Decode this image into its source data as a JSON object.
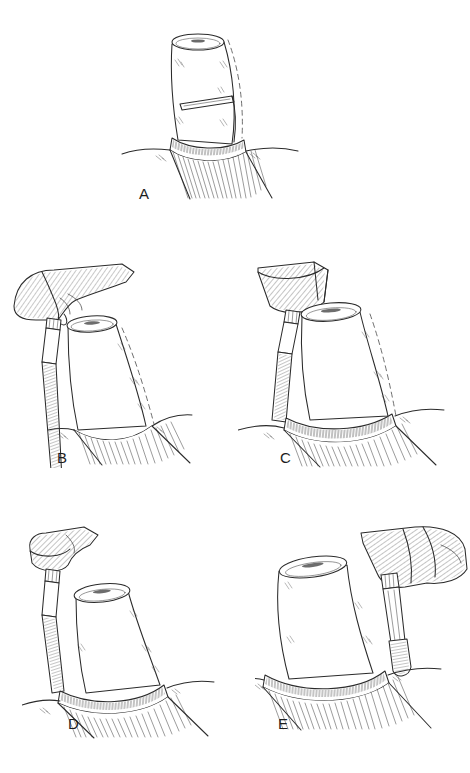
{
  "figure": {
    "background_color": "#ffffff",
    "ink_color": "#2b2b2b",
    "panel_count": 5,
    "labels": {
      "a": "A",
      "b": "B",
      "c": "C",
      "d": "D",
      "e": "E"
    },
    "panels": [
      {
        "id": "a",
        "label": "A",
        "caption_position": "bottom-left",
        "elements": [
          "prepared-tooth-crown",
          "shoulder-step",
          "gingival-collar",
          "gum-line",
          "root-hatching",
          "dashed-original-contour"
        ]
      },
      {
        "id": "b",
        "label": "B",
        "caption_position": "bottom-left",
        "elements": [
          "hand-holding-handpiece",
          "bur-shank",
          "tapered-bur",
          "prepared-tooth-crown",
          "gum-line",
          "root-hatching",
          "dashed-original-contour"
        ]
      },
      {
        "id": "c",
        "label": "C",
        "caption_position": "bottom-left",
        "elements": [
          "handpiece-head",
          "bur-shank",
          "tapered-bur",
          "prepared-tooth-crown",
          "gingival-collar",
          "gum-line",
          "root-hatching",
          "dashed-original-contour"
        ]
      },
      {
        "id": "d",
        "label": "D",
        "caption_position": "bottom-left",
        "elements": [
          "handpiece-head",
          "bur-shank",
          "tapered-bur",
          "prepared-tooth-crown",
          "gingival-collar",
          "gum-line",
          "root-hatching"
        ]
      },
      {
        "id": "e",
        "label": "E",
        "caption_position": "bottom-left",
        "elements": [
          "hand-holding-handpiece",
          "bur-shank",
          "round-end-bur",
          "prepared-tooth-crown",
          "gingival-collar",
          "gum-line",
          "root-hatching"
        ]
      }
    ]
  }
}
